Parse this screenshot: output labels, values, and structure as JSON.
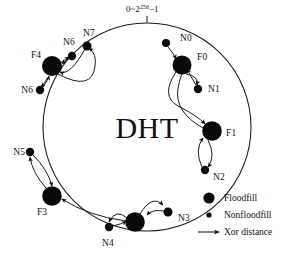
{
  "figure": {
    "center_title": "DHT",
    "range_label": {
      "prefix": "0~2",
      "exponent": "256",
      "suffix": "−1"
    },
    "ring": {
      "cx": 147,
      "cy": 127,
      "r": 104,
      "tick_label_anchor_y": 23
    }
  },
  "legend": {
    "items": [
      {
        "marker": "large-dot",
        "label": "Floodfill"
      },
      {
        "marker": "small-dot",
        "label": "Nonfloodfill"
      },
      {
        "marker": "arrow",
        "label": "Xor distance"
      }
    ]
  },
  "nodes": [
    {
      "id": "N0",
      "label": "N0",
      "type": "nonfloodfill",
      "x": 166,
      "y": 43,
      "r": 4.0,
      "lx": 180,
      "ly": 41,
      "anchor": "start"
    },
    {
      "id": "F0",
      "label": "F0",
      "type": "floodfill",
      "x": 182,
      "y": 65,
      "r": 9.5,
      "lx": 197,
      "ly": 60,
      "anchor": "start"
    },
    {
      "id": "N1",
      "label": "N1",
      "type": "nonfloodfill",
      "x": 198,
      "y": 89,
      "r": 4.2,
      "lx": 208,
      "ly": 92,
      "anchor": "start"
    },
    {
      "id": "F1",
      "label": "F1",
      "type": "floodfill",
      "x": 212,
      "y": 131,
      "r": 9.8,
      "lx": 226,
      "ly": 136,
      "anchor": "start"
    },
    {
      "id": "N2",
      "label": "N2",
      "type": "nonfloodfill",
      "x": 205,
      "y": 170,
      "r": 4.2,
      "lx": 213,
      "ly": 180,
      "anchor": "start"
    },
    {
      "id": "N3",
      "label": "N3",
      "type": "nonfloodfill",
      "x": 168,
      "y": 212,
      "r": 4.5,
      "lx": 178,
      "ly": 221,
      "anchor": "start"
    },
    {
      "id": "FX",
      "label": "",
      "type": "floodfill",
      "x": 135,
      "y": 222,
      "r": 9.8,
      "lx": 0,
      "ly": 0,
      "anchor": "middle"
    },
    {
      "id": "N4",
      "label": "N4",
      "type": "nonfloodfill",
      "x": 109,
      "y": 227,
      "r": 4.2,
      "lx": 108,
      "ly": 246,
      "anchor": "middle"
    },
    {
      "id": "F3",
      "label": "F3",
      "type": "floodfill",
      "x": 52,
      "y": 196,
      "r": 9.8,
      "lx": 42,
      "ly": 215,
      "anchor": "middle"
    },
    {
      "id": "N5",
      "label": "N5",
      "type": "nonfloodfill",
      "x": 30,
      "y": 152,
      "r": 4.2,
      "lx": 25,
      "ly": 155,
      "anchor": "end"
    },
    {
      "id": "N6b",
      "label": "N6",
      "type": "nonfloodfill",
      "x": 40,
      "y": 90,
      "r": 4.2,
      "lx": 33,
      "ly": 93,
      "anchor": "end"
    },
    {
      "id": "F4",
      "label": "F4",
      "type": "floodfill",
      "x": 52,
      "y": 66,
      "r": 10.0,
      "lx": 36,
      "ly": 58,
      "anchor": "middle"
    },
    {
      "id": "N6a",
      "label": "N6",
      "type": "nonfloodfill",
      "x": 72,
      "y": 56,
      "r": 4.2,
      "lx": 69,
      "ly": 45,
      "anchor": "middle"
    },
    {
      "id": "N7",
      "label": "N7",
      "type": "nonfloodfill",
      "x": 87,
      "y": 46,
      "r": 4.5,
      "lx": 89,
      "ly": 36,
      "anchor": "middle"
    }
  ],
  "edges": [
    {
      "from": "N0",
      "to": "F0",
      "d": "M 168 47 Q 174 54 176 59"
    },
    {
      "from": "N1",
      "to": "F0",
      "d": "M 196 85 Q 190 75 187 69"
    },
    {
      "from": "F0",
      "to": "N1",
      "d": "M 186 74 Q 199 76 197 85"
    },
    {
      "from": "F0",
      "to": "F1",
      "d": "M 176 72 Q 160 96 178 106 Q 198 116 205 124"
    },
    {
      "from": "F1",
      "to": "F0",
      "d": "M 203 128 Q 174 112 178 88 Q 181 72 186 68"
    },
    {
      "from": "N2",
      "to": "F1",
      "d": "M 202 167 Q 194 150 203 138"
    },
    {
      "from": "F1",
      "to": "N2",
      "d": "M 208 140 Q 216 156 208 167"
    },
    {
      "from": "N3",
      "to": "FX",
      "d": "M 164 211 Q 152 209 147 215"
    },
    {
      "from": "FX",
      "to": "N3",
      "d": "M 140 214 Q 152 194 163 205"
    },
    {
      "from": "N4",
      "to": "FX",
      "d": "M 113 226 Q 122 224 126 221"
    },
    {
      "from": "FX",
      "to": "N4",
      "d": "M 127 218 Q 116 208 109 222"
    },
    {
      "from": "FX",
      "to": "F3",
      "d": "M 126 221 Q 88 216 62 199"
    },
    {
      "from": "N5",
      "to": "F3",
      "d": "M 33 155 Q 48 170 52 186"
    },
    {
      "from": "F3",
      "to": "N5",
      "d": "M 46 188 Q 32 172 30 157"
    },
    {
      "from": "N6b",
      "to": "F4",
      "d": "M 43 87 Q 48 80 49 76"
    },
    {
      "from": "F4",
      "to": "N6b",
      "d": "M 49 76 Q 44 84 41 87"
    },
    {
      "from": "N6a",
      "to": "F4",
      "d": "M 69 58 Q 64 62 62 64"
    },
    {
      "from": "F4",
      "to": "N6a",
      "d": "M 60 63 Q 66 59 69 57"
    },
    {
      "from": "N7",
      "to": "F4",
      "d": "M 85 49 Q 70 76 60 72"
    },
    {
      "from": "F4",
      "to": "N7",
      "d": "M 58 74 Q 92 92 95 66 Q 97 54 89 48"
    }
  ]
}
